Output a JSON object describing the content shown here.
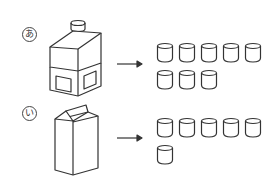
{
  "items": [
    {
      "label": "あ",
      "container": "square-bottle",
      "cups": 8,
      "rows": [
        5,
        3
      ]
    },
    {
      "label": "い",
      "container": "milk-carton",
      "cups": 6,
      "rows": [
        5,
        1
      ]
    }
  ],
  "colors": {
    "stroke": "#333333",
    "background": "#ffffff"
  }
}
